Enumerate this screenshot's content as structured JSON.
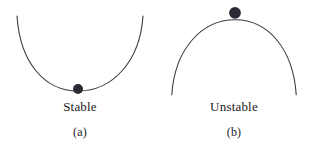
{
  "figure": {
    "background_color": "#ffffff",
    "curve_color": "#3a3a42",
    "ball_color": "#2b2b33",
    "text_color": "#1a1a1a",
    "panels": [
      {
        "id": "stable",
        "caption": "Stable",
        "tag": "(a)",
        "shape": "concave-up-bowl",
        "ball_position": "bottom-center",
        "curve_path": "M 17 16 C 20 62, 44 91, 78 91 C 112 91, 140 62, 143 16",
        "ball_cx": 78,
        "ball_cy": 89,
        "ball_r": 5
      },
      {
        "id": "unstable",
        "caption": "Unstable",
        "tag": "(b)",
        "shape": "concave-down-dome",
        "ball_position": "top-center",
        "curve_path": "M 17 96 C 20 50, 47 20, 81 20 C 115 20, 140 50, 143 96",
        "ball_cx": 81,
        "ball_cy": 13,
        "ball_r": 6
      }
    ]
  }
}
